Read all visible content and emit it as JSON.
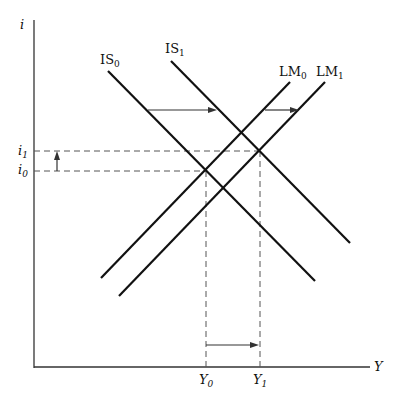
{
  "diagram": {
    "axes": {
      "y_label": "i",
      "x_label": "Y",
      "y_ticks": [
        {
          "label": "i",
          "sub": "1"
        },
        {
          "label": "i",
          "sub": "0"
        }
      ],
      "x_ticks": [
        {
          "label": "Y",
          "sub": "0"
        },
        {
          "label": "Y",
          "sub": "1"
        }
      ]
    },
    "curves": [
      {
        "name": "IS",
        "sub": "0"
      },
      {
        "name": "IS",
        "sub": "1"
      },
      {
        "name": "LM",
        "sub": "0"
      },
      {
        "name": "LM",
        "sub": "1"
      }
    ],
    "colors": {
      "line": "#111111",
      "dashed": "#555555"
    }
  }
}
